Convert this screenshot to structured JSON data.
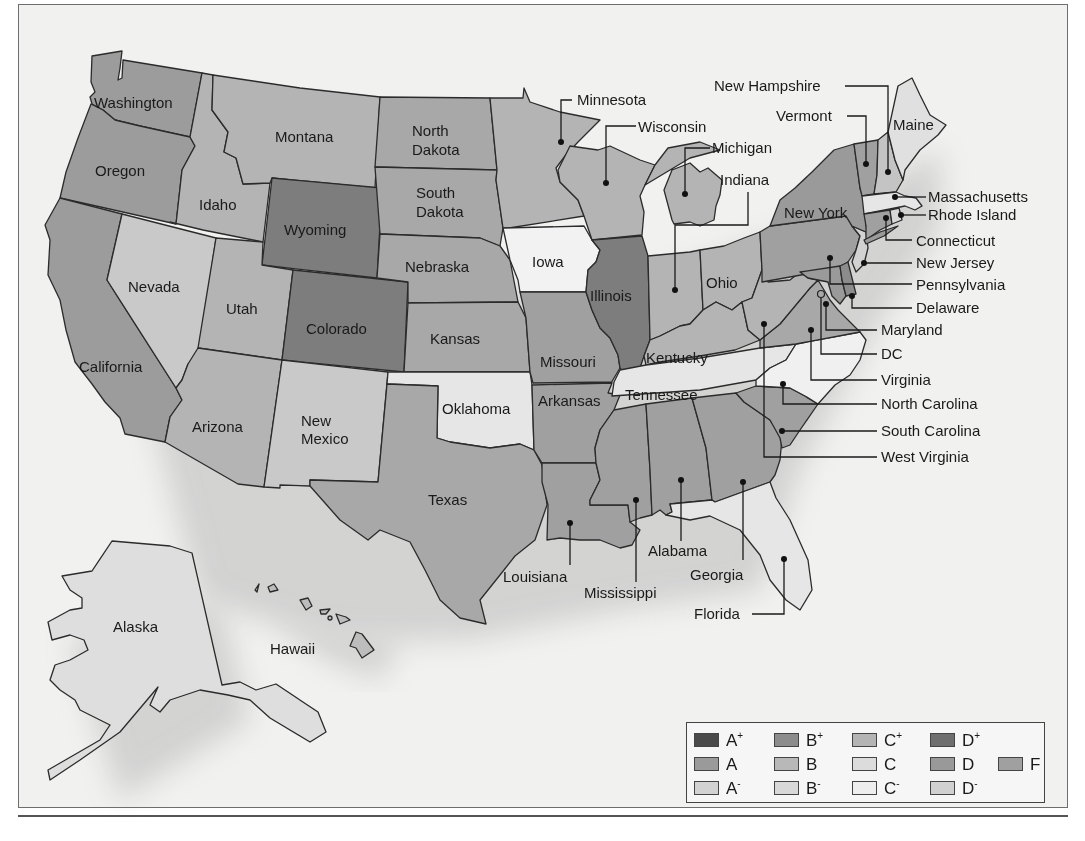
{
  "legend": {
    "items": [
      {
        "grade": "A",
        "mod": "+",
        "color": "#4a4a4a"
      },
      {
        "grade": "B",
        "mod": "+",
        "color": "#8c8c8c"
      },
      {
        "grade": "C",
        "mod": "+",
        "color": "#b4b4b4"
      },
      {
        "grade": "D",
        "mod": "+",
        "color": "#6e6e6e"
      },
      {
        "grade": "A",
        "mod": "",
        "color": "#9a9a9a"
      },
      {
        "grade": "B",
        "mod": "",
        "color": "#b8b8b8"
      },
      {
        "grade": "C",
        "mod": "",
        "color": "#dcdcdc"
      },
      {
        "grade": "D",
        "mod": "",
        "color": "#999999"
      },
      {
        "grade": "F",
        "mod": "",
        "color": "#a0a0a0"
      },
      {
        "grade": "A",
        "mod": "-",
        "color": "#d2d2d2"
      },
      {
        "grade": "B",
        "mod": "-",
        "color": "#d8d8d8"
      },
      {
        "grade": "C",
        "mod": "-",
        "color": "#eeeeee"
      },
      {
        "grade": "D",
        "mod": "-",
        "color": "#d0d0d0"
      }
    ]
  },
  "states": {
    "washington": {
      "label": "Washington",
      "fill": "#9c9c9c"
    },
    "oregon": {
      "label": "Oregon",
      "fill": "#9c9c9c"
    },
    "california": {
      "label": "California",
      "fill": "#9c9c9c"
    },
    "idaho": {
      "label": "Idaho",
      "fill": "#b4b4b4"
    },
    "nevada": {
      "label": "Nevada",
      "fill": "#c9c9c9"
    },
    "montana": {
      "label": "Montana",
      "fill": "#b4b4b4"
    },
    "wyoming": {
      "label": "Wyoming",
      "fill": "#7d7d7d"
    },
    "utah": {
      "label": "Utah",
      "fill": "#b4b4b4"
    },
    "colorado": {
      "label": "Colorado",
      "fill": "#7d7d7d"
    },
    "arizona": {
      "label": "Arizona",
      "fill": "#b4b4b4"
    },
    "new_mexico": {
      "label": "New\nMexico",
      "label_lines": [
        "New",
        "Mexico"
      ],
      "fill": "#c9c9c9"
    },
    "north_dakota": {
      "label": "North Dakota",
      "label_lines": [
        "North",
        "Dakota"
      ],
      "fill": "#a8a8a8"
    },
    "south_dakota": {
      "label": "South Dakota",
      "label_lines": [
        "South",
        "Dakota"
      ],
      "fill": "#a8a8a8"
    },
    "nebraska": {
      "label": "Nebraska",
      "fill": "#a8a8a8"
    },
    "kansas": {
      "label": "Kansas",
      "fill": "#a8a8a8"
    },
    "oklahoma": {
      "label": "Oklahoma",
      "fill": "#e6e6e6"
    },
    "texas": {
      "label": "Texas",
      "fill": "#a8a8a8"
    },
    "minnesota": {
      "label": "Minnesota",
      "fill": "#b4b4b4"
    },
    "iowa": {
      "label": "Iowa",
      "fill": "#f2f2f2"
    },
    "missouri": {
      "label": "Missouri",
      "fill": "#a0a0a0"
    },
    "arkansas": {
      "label": "Arkansas",
      "fill": "#a0a0a0"
    },
    "louisiana": {
      "label": "Louisiana",
      "fill": "#a0a0a0"
    },
    "wisconsin": {
      "label": "Wisconsin",
      "fill": "#b4b4b4"
    },
    "illinois": {
      "label": "Illinois",
      "fill": "#7d7d7d"
    },
    "michigan": {
      "label": "Michigan",
      "fill": "#b4b4b4"
    },
    "indiana": {
      "label": "Indiana",
      "fill": "#b4b4b4"
    },
    "ohio": {
      "label": "Ohio",
      "fill": "#b4b4b4"
    },
    "kentucky": {
      "label": "Kentucky",
      "fill": "#b4b4b4"
    },
    "tennessee": {
      "label": "Tennessee",
      "fill": "#e6e6e6"
    },
    "mississippi": {
      "label": "Mississippi",
      "fill": "#a0a0a0"
    },
    "alabama": {
      "label": "Alabama",
      "fill": "#a0a0a0"
    },
    "georgia": {
      "label": "Georgia",
      "fill": "#a0a0a0"
    },
    "florida": {
      "label": "Florida",
      "fill": "#e6e6e6"
    },
    "south_carolina": {
      "label": "South Carolina",
      "fill": "#a0a0a0"
    },
    "north_carolina": {
      "label": "North Carolina",
      "fill": "#f0f0f0"
    },
    "virginia": {
      "label": "Virginia",
      "fill": "#a8a8a8"
    },
    "west_virginia": {
      "label": "West Virginia",
      "fill": "#b4b4b4"
    },
    "maryland": {
      "label": "Maryland",
      "fill": "#9a9a9a"
    },
    "delaware": {
      "label": "Delaware",
      "fill": "#8c8c8c"
    },
    "dc": {
      "label": "DC",
      "fill": "#d2d2d2"
    },
    "pennsylvania": {
      "label": "Pennsylvania",
      "fill": "#a0a0a0"
    },
    "new_jersey": {
      "label": "New Jersey",
      "fill": "#d2d2d2"
    },
    "new_york": {
      "label": "New York",
      "fill": "#9a9a9a"
    },
    "connecticut": {
      "label": "Connecticut",
      "fill": "#a0a0a0"
    },
    "rhode_island": {
      "label": "Rhode Island",
      "fill": "#d8d8d8"
    },
    "massachusetts": {
      "label": "Massachusetts",
      "fill": "#e6e6e6"
    },
    "vermont": {
      "label": "Vermont",
      "fill": "#a0a0a0"
    },
    "new_hampshire": {
      "label": "New Hampshire",
      "fill": "#c4c4c4"
    },
    "maine": {
      "label": "Maine",
      "fill": "#e0e0e0"
    },
    "alaska": {
      "label": "Alaska",
      "fill": "#dedede"
    },
    "hawaii": {
      "label": "Hawaii",
      "fill": "#bdbdbd"
    }
  }
}
